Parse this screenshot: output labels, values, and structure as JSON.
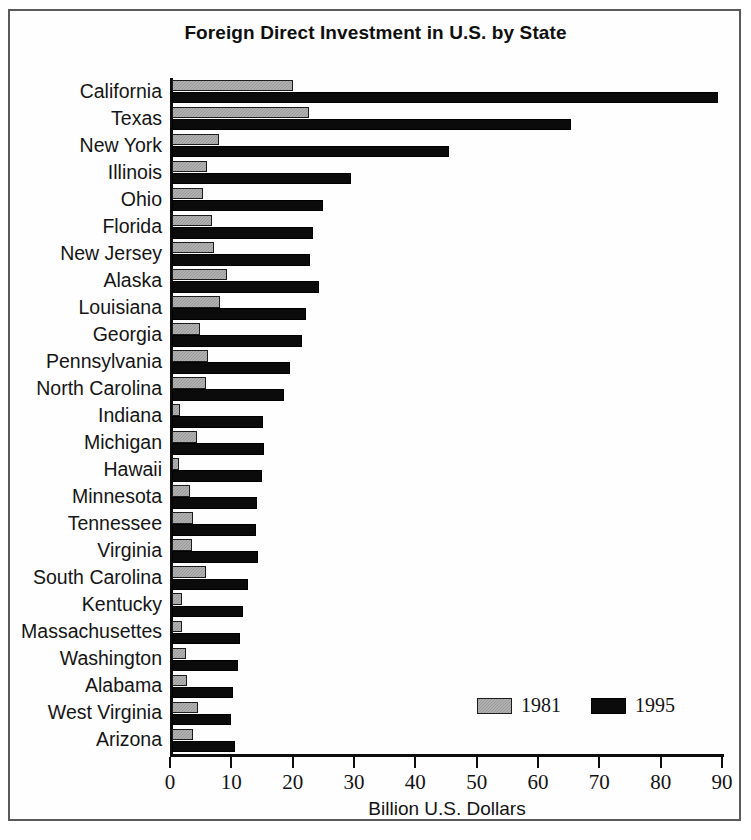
{
  "chart_data": {
    "type": "bar",
    "orientation": "horizontal",
    "title": "Foreign Direct Investment in U.S. by State",
    "xlabel": "Billion U.S. Dollars",
    "ylabel": "",
    "xlim": [
      0,
      90
    ],
    "xticks": [
      0,
      10,
      20,
      30,
      40,
      50,
      60,
      70,
      80,
      90
    ],
    "xtick_labels": [
      "0",
      "10",
      "20",
      "30",
      "40",
      "50",
      "60",
      "70",
      "80",
      "90"
    ],
    "grid": false,
    "legend_position": "bottom-right",
    "categories": [
      "California",
      "Texas",
      "New York",
      "Illinois",
      "Ohio",
      "Florida",
      "New Jersey",
      "Alaska",
      "Louisiana",
      "Georgia",
      "Pennsylvania",
      "North Carolina",
      "Indiana",
      "Michigan",
      "Hawaii",
      "Minnesota",
      "Tennessee",
      "Virginia",
      "South Carolina",
      "Kentucky",
      "Massachusettes",
      "Washington",
      "Alabama",
      "West Virginia",
      "Arizona"
    ],
    "series": [
      {
        "name": "1981",
        "color": "#9a9a9a",
        "values": [
          19.8,
          22.4,
          7.7,
          5.7,
          5.1,
          6.5,
          6.8,
          8.9,
          7.8,
          4.6,
          5.9,
          5.6,
          1.3,
          4.0,
          1.2,
          3.0,
          3.4,
          3.2,
          5.5,
          1.6,
          1.6,
          2.3,
          2.4,
          4.2,
          3.4
        ]
      },
      {
        "name": "1995",
        "color": "#0b0b0b",
        "values": [
          89.0,
          65.0,
          45.2,
          29.2,
          24.6,
          23.0,
          22.5,
          23.9,
          21.8,
          21.2,
          19.2,
          18.2,
          14.8,
          15.0,
          14.6,
          13.8,
          13.7,
          14.0,
          12.4,
          11.6,
          11.1,
          10.7,
          10.0,
          9.7,
          10.2
        ]
      }
    ]
  },
  "legend": {
    "items": [
      {
        "label": "1981",
        "swatch": "gray-swatch"
      },
      {
        "label": "1995",
        "swatch": "black-swatch"
      }
    ]
  },
  "colors": {
    "series_1981": "#9a9a9a",
    "series_1995": "#0b0b0b",
    "axis": "#0d0d0d",
    "text": "#131313",
    "frame": "#5a5a5a",
    "background": "#ffffff"
  }
}
